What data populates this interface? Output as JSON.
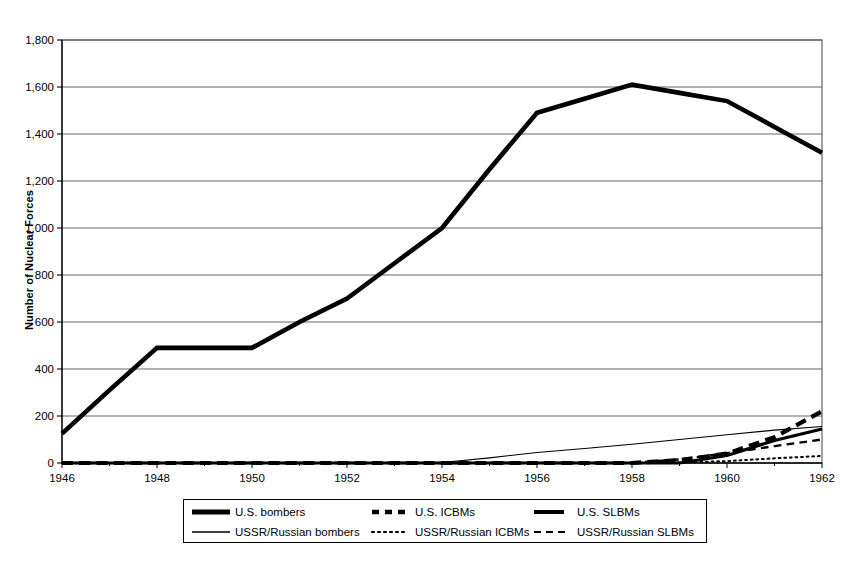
{
  "chart_data": {
    "type": "line",
    "title": "",
    "xlabel": "",
    "ylabel": "Number of Nuclear Forces",
    "xlim": [
      1946,
      1962
    ],
    "ylim": [
      0,
      1800
    ],
    "ytick_values": [
      0,
      200,
      400,
      600,
      800,
      1000,
      1200,
      1400,
      1600,
      1800
    ],
    "ytick_labels": [
      "0",
      "200",
      "400",
      "600",
      "800",
      "1,000",
      "1,200",
      "1,400",
      "1,600",
      "1,800"
    ],
    "xtick_values": [
      1946,
      1948,
      1950,
      1952,
      1954,
      1956,
      1958,
      1960,
      1962
    ],
    "xtick_labels": [
      "1946",
      "1948",
      "1950",
      "1952",
      "1954",
      "1956",
      "1958",
      "1960",
      "1962"
    ],
    "x": [
      1946,
      1947,
      1948,
      1949,
      1950,
      1951,
      1952,
      1953,
      1954,
      1955,
      1956,
      1957,
      1958,
      1959,
      1960,
      1961,
      1962
    ],
    "grid": "horizontal",
    "legend_position": "bottom",
    "series": [
      {
        "name": "U.S. bombers",
        "style": "solid",
        "width": 4.6,
        "color": "#000000",
        "values": [
          125,
          310,
          490,
          490,
          490,
          600,
          700,
          850,
          1000,
          1250,
          1490,
          1550,
          1610,
          1575,
          1540,
          1430,
          1320
        ]
      },
      {
        "name": "U.S. ICBMs",
        "style": "dashed",
        "width": 4.2,
        "color": "#000000",
        "values": [
          0,
          0,
          0,
          0,
          0,
          0,
          0,
          0,
          0,
          0,
          0,
          0,
          0,
          12,
          40,
          110,
          220
        ]
      },
      {
        "name": "U.S. SLBMs",
        "style": "solid",
        "width": 3.2,
        "color": "#000000",
        "values": [
          0,
          0,
          0,
          0,
          0,
          0,
          0,
          0,
          0,
          0,
          0,
          0,
          0,
          0,
          32,
          96,
          145
        ]
      },
      {
        "name": "USSR/Russian bombers",
        "style": "solid",
        "width": 1.1,
        "color": "#000000",
        "values": [
          0,
          0,
          0,
          0,
          0,
          0,
          0,
          0,
          2,
          22,
          45,
          62,
          80,
          100,
          120,
          140,
          155
        ]
      },
      {
        "name": "USSR/Russian ICBMs",
        "style": "dotted",
        "width": 2.0,
        "color": "#000000",
        "values": [
          0,
          0,
          0,
          0,
          0,
          0,
          0,
          0,
          0,
          0,
          0,
          0,
          0,
          2,
          8,
          20,
          30
        ]
      },
      {
        "name": "USSR/Russian SLBMs",
        "style": "dashed-thin",
        "width": 2.4,
        "color": "#000000",
        "values": [
          0,
          0,
          0,
          0,
          0,
          0,
          0,
          0,
          0,
          0,
          0,
          0,
          0,
          15,
          42,
          72,
          100
        ]
      }
    ]
  },
  "axis": {
    "y_title": "Number of Nuclear Forces",
    "y_ticks": [
      "1,800",
      "1,600",
      "1,400",
      "1,200",
      "1,000",
      "800",
      "600",
      "400",
      "200",
      "0"
    ],
    "x_ticks": [
      "1946",
      "1948",
      "1950",
      "1952",
      "1954",
      "1956",
      "1958",
      "1960",
      "1962"
    ]
  },
  "legend": {
    "row1": [
      {
        "label": "U.S. bombers",
        "key": "thick-solid-line"
      },
      {
        "label": "U.S. ICBMs",
        "key": "thick-dashed-line"
      },
      {
        "label": "U.S. SLBMs",
        "key": "medium-solid-line"
      }
    ],
    "row2": [
      {
        "label": "USSR/Russian bombers",
        "key": "thin-solid-line"
      },
      {
        "label": "USSR/Russian ICBMs",
        "key": "dotted-line"
      },
      {
        "label": "USSR/Russian SLBMs",
        "key": "thin-dashed-line"
      }
    ]
  }
}
